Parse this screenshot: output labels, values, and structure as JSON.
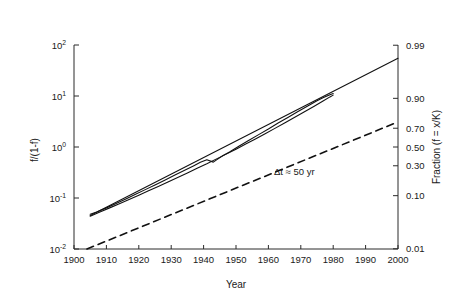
{
  "chart_data": {
    "type": "line",
    "title": "",
    "xlabel": "Year",
    "ylabel": "f/(1-f)",
    "ylabel_right": "Fraction (f = x/K)",
    "xlim": [
      1900,
      2000
    ],
    "ylim": [
      0.01,
      100
    ],
    "yscale": "log",
    "grid": false,
    "legend": null,
    "xticks": [
      1900,
      1910,
      1920,
      1930,
      1940,
      1950,
      1960,
      1970,
      1980,
      1990,
      2000
    ],
    "xticklabels": [
      "1900",
      "1910",
      "1920",
      "1930",
      "1940",
      "1950",
      "1960",
      "1970",
      "1980",
      "1990",
      "2000"
    ],
    "yticks": [
      0.01,
      0.1,
      1,
      10,
      100
    ],
    "yticklabels": [
      "10-2",
      "10-1",
      "100",
      "101",
      "102"
    ],
    "yticklabels_mantissa": [
      "10",
      "10",
      "10",
      "10",
      "10"
    ],
    "yticklabels_exponent": [
      "-2",
      "-1",
      "0",
      "1",
      "2"
    ],
    "right_yticks": [
      0.01,
      0.1,
      0.3,
      0.5,
      0.7,
      0.9,
      0.99
    ],
    "right_yticklabels": [
      "0.01",
      "0.10",
      "0.30",
      "0.50",
      "0.70",
      "0.90",
      "0.99"
    ],
    "annotations": [
      {
        "text": "Δt ≈ 50 yr",
        "x": 1968,
        "y": 0.28
      }
    ],
    "series": [
      {
        "name": "data",
        "style": "solid",
        "x": [
          1905,
          1907,
          1910,
          1913,
          1916,
          1919,
          1922,
          1925,
          1928,
          1931,
          1934,
          1937,
          1939,
          1941,
          1943,
          1944,
          1946,
          1948,
          1951,
          1954,
          1957,
          1960,
          1963,
          1966,
          1969,
          1972,
          1975,
          1977,
          1979,
          1980
        ],
        "y": [
          0.048,
          0.053,
          0.064,
          0.078,
          0.096,
          0.118,
          0.146,
          0.18,
          0.224,
          0.279,
          0.345,
          0.43,
          0.5,
          0.56,
          0.505,
          0.56,
          0.68,
          0.8,
          1.05,
          1.35,
          1.75,
          2.25,
          2.95,
          3.8,
          4.9,
          6.3,
          8.1,
          9.3,
          10.6,
          11.2
        ]
      },
      {
        "name": "data-second-trace",
        "style": "solid",
        "x": [
          1905,
          1908,
          1911,
          1914,
          1917,
          1920,
          1923,
          1926,
          1929,
          1932,
          1935,
          1938,
          1941,
          1944,
          1947,
          1950,
          1953,
          1956,
          1959,
          1962,
          1965,
          1968,
          1971,
          1974,
          1977,
          1979,
          1980
        ],
        "y": [
          0.044,
          0.053,
          0.064,
          0.077,
          0.093,
          0.113,
          0.138,
          0.168,
          0.206,
          0.252,
          0.31,
          0.385,
          0.47,
          0.585,
          0.725,
          0.905,
          1.14,
          1.44,
          1.82,
          2.32,
          2.95,
          3.78,
          4.85,
          6.25,
          8.05,
          9.6,
          10.4
        ]
      },
      {
        "name": "logistic-fit-line",
        "style": "solid-straight",
        "x": [
          1905,
          2000
        ],
        "y": [
          0.0455,
          55.0
        ]
      },
      {
        "name": "reference-line",
        "style": "dashed",
        "x": [
          1904,
          2000
        ],
        "y": [
          0.01,
          3.1
        ]
      }
    ]
  },
  "axes": {
    "x_title": "Year",
    "y_title_left": "f/(1-f)",
    "y_title_right": "Fraction (f = x/K)"
  },
  "colors": {
    "background": "#ffffff",
    "axis": "#2b2b2b",
    "data": "#111111",
    "reference": "#111111",
    "text": "#1a1a1a"
  }
}
